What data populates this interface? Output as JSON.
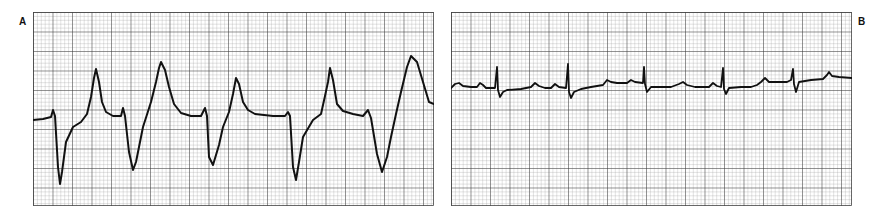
{
  "figure": {
    "panels": [
      {
        "id": "A",
        "label": "A",
        "description": "Wide-complex rhythm with deep negative QRS deflections and tall peaked T waves",
        "beat_count": 5
      },
      {
        "id": "B",
        "label": "B",
        "description": "Low-amplitude rhythm with narrow sharp spikes and small P/T waves",
        "spike_count": 5
      }
    ],
    "grid": {
      "major_spacing_px": 19.5,
      "minor_per_major": 5,
      "line_color": "#333333",
      "background": "#ffffff"
    },
    "trace_color": "#111111"
  }
}
